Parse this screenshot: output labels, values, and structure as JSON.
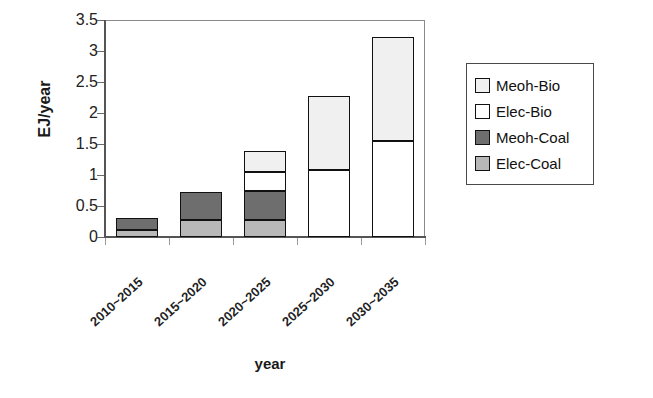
{
  "chart_data": {
    "type": "bar",
    "title": "",
    "stacked": true,
    "xlabel": "year",
    "ylabel": "EJ/year",
    "ylim": [
      0,
      3.5
    ],
    "yticks": [
      "0",
      "0.5",
      "1",
      "1.5",
      "2",
      "2.5",
      "3",
      "3.5"
    ],
    "ytick_values": [
      0,
      0.5,
      1,
      1.5,
      2,
      2.5,
      3,
      3.5
    ],
    "grid": false,
    "legend_position": "right",
    "categories": [
      "2010~2015",
      "2015~2020",
      "2020~2025",
      "2025~2030",
      "2030~2035"
    ],
    "series": [
      {
        "name": "Elec-Coal",
        "color": "#b8b8b8",
        "values": [
          0.12,
          0.27,
          0.27,
          0.0,
          0.0
        ]
      },
      {
        "name": "Meoh-Coal",
        "color": "#6e6e6e",
        "values": [
          0.18,
          0.46,
          0.47,
          0.0,
          0.0
        ]
      },
      {
        "name": "Elec-Bio",
        "color": "#ffffff",
        "values": [
          0.0,
          0.0,
          0.31,
          1.08,
          1.55
        ]
      },
      {
        "name": "Meoh-Bio",
        "color": "#f0f0f0",
        "values": [
          0.0,
          0.0,
          0.33,
          1.19,
          1.67
        ]
      }
    ],
    "totals": [
      0.3,
      0.73,
      1.38,
      2.27,
      3.22
    ],
    "legend_order": [
      "Meoh-Bio",
      "Elec-Bio",
      "Meoh-Coal",
      "Elec-Coal"
    ]
  },
  "legend": {
    "items": [
      {
        "label": "Meoh-Bio",
        "color": "#f0f0f0"
      },
      {
        "label": "Elec-Bio",
        "color": "#ffffff"
      },
      {
        "label": "Meoh-Coal",
        "color": "#6e6e6e"
      },
      {
        "label": "Elec-Coal",
        "color": "#b8b8b8"
      }
    ]
  },
  "axes": {
    "y_title": "EJ/year",
    "x_title": "year"
  }
}
